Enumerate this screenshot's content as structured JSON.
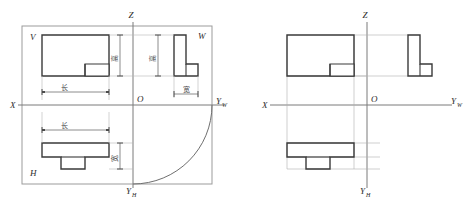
{
  "figure": {
    "stroke_dark": "#3a3a3a",
    "stroke_light": "#8a8a8a",
    "stroke_thin": "#9b9b9b",
    "background": "#ffffff"
  },
  "left_diagram": {
    "name": "projection-planes-with-dimensions",
    "frame": {
      "x": 22,
      "y": 26,
      "w": 190,
      "h": 158
    },
    "plane_labels": [
      {
        "id": "V",
        "text": "V",
        "x": 30,
        "y": 40
      },
      {
        "id": "W",
        "text": "W",
        "x": 198,
        "y": 39
      },
      {
        "id": "H",
        "text": "H",
        "x": 30,
        "y": 176
      }
    ],
    "axis_labels": [
      {
        "id": "Z",
        "text": "Z",
        "sub": "",
        "x": 131,
        "y": 18
      },
      {
        "id": "X",
        "text": "X",
        "sub": "",
        "x": 10,
        "y": 103
      },
      {
        "id": "O",
        "text": "O",
        "sub": "",
        "x": 137,
        "y": 103
      },
      {
        "id": "YW",
        "text": "Y",
        "sub": "W",
        "x": 220,
        "y": 104
      },
      {
        "id": "YH",
        "text": "Y",
        "sub": "H",
        "x": 129,
        "y": 192
      }
    ],
    "dimension_labels": [
      {
        "id": "chang-front",
        "text": "长",
        "meaning": "length",
        "x": 61,
        "y": 88
      },
      {
        "id": "chang-top",
        "text": "长",
        "meaning": "length",
        "x": 61,
        "y": 126
      },
      {
        "id": "gao-front",
        "text": "高",
        "meaning": "height",
        "x": 117,
        "y": 57
      },
      {
        "id": "gao-side",
        "text": "高",
        "meaning": "height",
        "x": 155,
        "y": 57
      },
      {
        "id": "kuan-side",
        "text": "宽",
        "meaning": "width",
        "x": 185,
        "y": 89
      },
      {
        "id": "kuan-top",
        "text": "宽",
        "meaning": "width",
        "x": 116,
        "y": 157
      }
    ],
    "views": {
      "front": {
        "label": "front-view-V",
        "x": 42,
        "y": 35,
        "w": 67,
        "h": 41
      },
      "side": {
        "label": "side-view-W",
        "x": 174,
        "y": 35,
        "w": 12,
        "h": 41
      },
      "top": {
        "label": "top-view-H",
        "x": 42,
        "y": 143,
        "w": 67,
        "h": 14
      }
    }
  },
  "right_diagram": {
    "name": "projection-views-with-alignment-lines",
    "axis_labels": [
      {
        "id": "Z",
        "text": "Z",
        "sub": "",
        "x": 365,
        "y": 18
      },
      {
        "id": "X",
        "text": "X",
        "sub": "",
        "x": 263,
        "y": 103
      },
      {
        "id": "O",
        "text": "O",
        "sub": "",
        "x": 371,
        "y": 103
      },
      {
        "id": "YW",
        "text": "Y",
        "sub": "W",
        "x": 455,
        "y": 104
      },
      {
        "id": "YH",
        "text": "Y",
        "sub": "H",
        "x": 363,
        "y": 192
      }
    ],
    "views": {
      "front": {
        "label": "front-view",
        "x": 287,
        "y": 35,
        "w": 67,
        "h": 41
      },
      "side": {
        "label": "side-view",
        "x": 408,
        "y": 35,
        "w": 12,
        "h": 41
      },
      "top": {
        "label": "top-view",
        "x": 287,
        "y": 143,
        "w": 67,
        "h": 14
      }
    }
  }
}
